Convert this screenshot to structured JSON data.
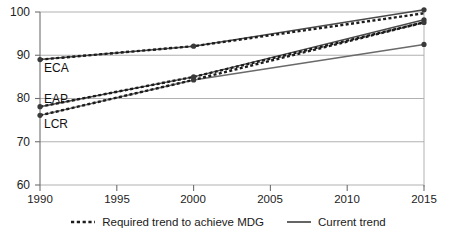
{
  "figure": {
    "clipped_header_text": "",
    "background_color": "#ffffff"
  },
  "axes": {
    "y_ticks": [
      "100",
      "90",
      "80",
      "70",
      "60"
    ],
    "x_ticks": [
      "1990",
      "1995",
      "2000",
      "2005",
      "2010",
      "2015"
    ],
    "grid_color": "#a8a8a8",
    "axis_color": "#6f6f6f"
  },
  "series_labels": {
    "eca": "ECA",
    "eap": "EAP",
    "lcr": "LCR"
  },
  "legend": {
    "required": "Required trend to achieve MDG",
    "current": "Current trend",
    "required_style": "dotted-dashed",
    "current_style": "solid",
    "required_color": "#1c1c1c",
    "current_color": "#555555"
  },
  "chart_data": {
    "type": "line",
    "title": "",
    "xlabel": "",
    "ylabel": "",
    "xlim": [
      1990,
      2015
    ],
    "ylim": [
      60,
      100
    ],
    "yticks": [
      60,
      70,
      80,
      90,
      100
    ],
    "xticks": [
      1990,
      1995,
      2000,
      2005,
      2010,
      2015
    ],
    "grid": "horizontal",
    "legend_position": "bottom-center",
    "annotations": [
      {
        "text": "ECA",
        "x": 1990.6,
        "y": 86.8
      },
      {
        "text": "EAP",
        "x": 1990.6,
        "y": 79.6
      },
      {
        "text": "LCR",
        "x": 1990.6,
        "y": 73.8
      }
    ],
    "series": [
      {
        "name": "ECA current trend",
        "region": "ECA",
        "style": "solid",
        "color": "#4a4a4a",
        "x": [
          1990,
          2000,
          2015
        ],
        "values": [
          89.0,
          92.1,
          100.5
        ]
      },
      {
        "name": "ECA required trend to achieve MDG",
        "region": "ECA",
        "style": "dashed",
        "color": "#1c1c1c",
        "x": [
          1990,
          2000,
          2015
        ],
        "values": [
          89.0,
          92.1,
          99.7
        ]
      },
      {
        "name": "EAP current trend",
        "region": "EAP",
        "style": "solid",
        "color": "#4a4a4a",
        "x": [
          1990,
          2000,
          2015
        ],
        "values": [
          78.1,
          85.0,
          98.2
        ]
      },
      {
        "name": "EAP required trend to achieve MDG",
        "region": "EAP",
        "style": "dashed",
        "color": "#1c1c1c",
        "x": [
          1990,
          2000,
          2015
        ],
        "values": [
          78.1,
          85.0,
          97.6
        ]
      },
      {
        "name": "LCR current trend",
        "region": "LCR",
        "style": "solid",
        "color": "#6a6a6a",
        "x": [
          1990,
          2000,
          2015
        ],
        "values": [
          76.1,
          84.3,
          92.5
        ]
      },
      {
        "name": "LCR required trend to achieve MDG",
        "region": "LCR",
        "style": "dashed",
        "color": "#1c1c1c",
        "x": [
          1990,
          2000,
          2015
        ],
        "values": [
          76.1,
          84.3,
          97.6
        ]
      }
    ],
    "markers": [
      {
        "x": 1990,
        "y": 89.0
      },
      {
        "x": 1990,
        "y": 78.1
      },
      {
        "x": 1990,
        "y": 76.1
      },
      {
        "x": 2000,
        "y": 92.1
      },
      {
        "x": 2000,
        "y": 85.0
      },
      {
        "x": 2000,
        "y": 84.3
      },
      {
        "x": 2015,
        "y": 100.5
      },
      {
        "x": 2015,
        "y": 98.2
      },
      {
        "x": 2015,
        "y": 97.6
      },
      {
        "x": 2015,
        "y": 92.5
      }
    ]
  }
}
